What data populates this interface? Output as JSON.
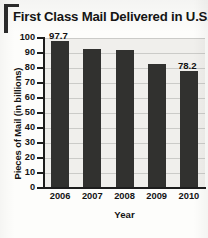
{
  "chart_data": {
    "type": "bar",
    "title": "First Class Mail Delivered in U.S.",
    "xlabel": "Year",
    "ylabel": "Pieces of Mail (in billions)",
    "categories": [
      "2006",
      "2007",
      "2008",
      "2009",
      "2010"
    ],
    "values": [
      97.7,
      92.8,
      91.7,
      83.0,
      78.2
    ],
    "point_labels": [
      "97.7",
      "",
      "",
      "",
      "78.2"
    ],
    "ylim": [
      0,
      100
    ],
    "yticks": [
      "0",
      "10",
      "20",
      "30",
      "40",
      "50",
      "60",
      "70",
      "80",
      "90",
      "100"
    ],
    "grid": true,
    "legend": "none",
    "bar_color": "#31312f",
    "plot_background": "#f0efec"
  }
}
